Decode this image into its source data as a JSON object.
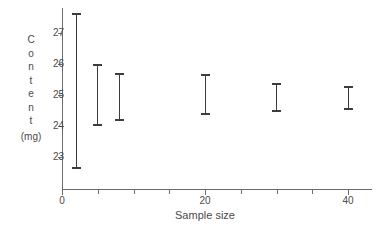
{
  "chart_data": {
    "type": "scatter",
    "title": "",
    "xlabel": "Sample size",
    "ylabel": "Content (mg)",
    "ylabel_stacked": [
      "C",
      "o",
      "n",
      "t",
      "e",
      "n",
      "t"
    ],
    "ylabel_units": "(mg)",
    "xlim": [
      0,
      43.5
    ],
    "ylim": [
      22.3,
      27.9
    ],
    "grid": false,
    "legend": null,
    "x_ticks_major": [
      0,
      20,
      40
    ],
    "x_tick_labels": [
      "0",
      "20",
      "40"
    ],
    "x_ticks_minor": [
      5,
      10,
      15,
      25,
      30,
      35
    ],
    "y_ticks": [
      23,
      24,
      25,
      26,
      27
    ],
    "y_tick_labels": [
      "23",
      "24",
      "25",
      "26",
      "27"
    ],
    "series": [
      {
        "name": "Content interval",
        "marker": "error-bar",
        "color": "#3d3d3d",
        "points": [
          {
            "x": 2,
            "low": 22.6,
            "high": 27.65
          },
          {
            "x": 5,
            "low": 24.0,
            "high": 26.0
          },
          {
            "x": 8,
            "low": 24.15,
            "high": 25.72
          },
          {
            "x": 20,
            "low": 24.35,
            "high": 25.68
          },
          {
            "x": 30,
            "low": 24.45,
            "high": 25.4
          },
          {
            "x": 40,
            "low": 24.52,
            "high": 25.3
          }
        ]
      }
    ]
  },
  "colors": {
    "axis": "#6b6b6b",
    "marker": "#3d3d3d",
    "text": "#4a4a4a",
    "background": "#ffffff"
  }
}
